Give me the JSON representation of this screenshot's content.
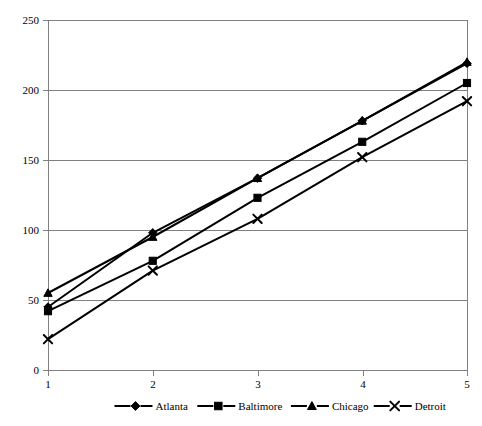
{
  "chart_data": {
    "type": "line",
    "title": "",
    "subtitle": "",
    "xlabel": "",
    "ylabel": "",
    "x": [
      1,
      2,
      3,
      4,
      5
    ],
    "categories": [
      "1",
      "2",
      "3",
      "4",
      "5"
    ],
    "xlim": [
      1,
      5
    ],
    "ylim": [
      0,
      250
    ],
    "y_ticks": [
      0,
      50,
      100,
      150,
      200,
      250
    ],
    "y_tick_labels": [
      "0",
      "50",
      "100",
      "150",
      "200",
      "250"
    ],
    "x_tick_labels": [
      "1",
      "2",
      "3",
      "4",
      "5"
    ],
    "grid": "horizontal",
    "legend_position": "bottom",
    "series": [
      {
        "name": "Atlanta",
        "marker": "diamond",
        "color": "#000000",
        "values": [
          45,
          98,
          137,
          178,
          219
        ]
      },
      {
        "name": "Baltimore",
        "marker": "square",
        "color": "#000000",
        "values": [
          42,
          78,
          123,
          163,
          205
        ]
      },
      {
        "name": "Chicago",
        "marker": "triangle",
        "color": "#000000",
        "values": [
          55,
          95,
          137,
          178,
          220
        ]
      },
      {
        "name": "Detroit",
        "marker": "x",
        "color": "#000000",
        "values": [
          22,
          71,
          108,
          152,
          192
        ]
      }
    ]
  },
  "axis": {
    "y_labels": [
      "250",
      "200",
      "150",
      "100",
      "50",
      "0"
    ],
    "x_labels": [
      "1",
      "2",
      "3",
      "4",
      "5"
    ]
  },
  "legend": {
    "items": [
      {
        "label": "Atlanta",
        "marker": "diamond-marker-icon"
      },
      {
        "label": "Baltimore",
        "marker": "square-marker-icon"
      },
      {
        "label": "Chicago",
        "marker": "triangle-marker-icon"
      },
      {
        "label": "Detroit",
        "marker": "x-marker-icon"
      }
    ]
  },
  "colors": {
    "series": "#000000",
    "grid": "#808080",
    "background": "#ffffff"
  }
}
